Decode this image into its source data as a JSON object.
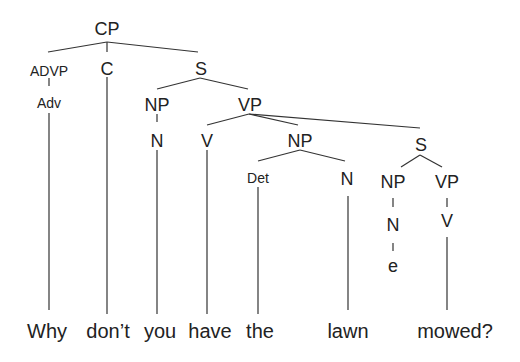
{
  "diagram": {
    "type": "syntax-tree",
    "nodes": {
      "cp": "CP",
      "advp": "ADVP",
      "c": "C",
      "s1": "S",
      "adv": "Adv",
      "np1": "NP",
      "vp1": "VP",
      "n1": "N",
      "v1": "V",
      "np2": "NP",
      "s2": "S",
      "det": "Det",
      "n2": "N",
      "np3": "NP",
      "vp2": "VP",
      "n3": "N",
      "v2": "V",
      "empty": "e"
    },
    "words": [
      "Why",
      "don’t",
      "you",
      "have",
      "the",
      "lawn",
      "mowed?"
    ]
  }
}
